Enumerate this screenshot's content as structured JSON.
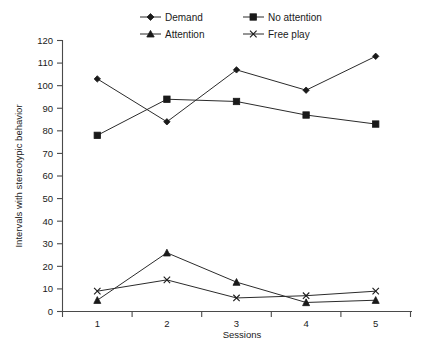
{
  "chart_data": {
    "type": "line",
    "title": "",
    "xlabel": "Sessions",
    "ylabel": "Intervals with stereotypic behavior",
    "categories": [
      "1",
      "2",
      "3",
      "4",
      "5"
    ],
    "xtick_labels": [
      "1",
      "2",
      "3",
      "4",
      "5"
    ],
    "ytick_labels": [
      "0",
      "10",
      "20",
      "30",
      "40",
      "50",
      "60",
      "70",
      "80",
      "90",
      "100",
      "110",
      "120"
    ],
    "ylim": [
      0,
      120
    ],
    "ytick_step": 10,
    "grid": false,
    "legend_position": "top",
    "series": [
      {
        "name": "Demand",
        "marker": "diamond",
        "values": [
          103,
          84,
          107,
          98,
          113
        ]
      },
      {
        "name": "No attention",
        "marker": "square",
        "values": [
          78,
          94,
          93,
          87,
          83
        ]
      },
      {
        "name": "Attention",
        "marker": "triangle",
        "values": [
          5,
          26,
          13,
          4,
          5
        ]
      },
      {
        "name": "Free play",
        "marker": "x",
        "values": [
          9,
          14,
          6,
          7,
          9
        ]
      }
    ]
  },
  "legend": {
    "items": [
      {
        "label": "Demand",
        "marker": "diamond"
      },
      {
        "label": "No attention",
        "marker": "square"
      },
      {
        "label": "Attention",
        "marker": "triangle"
      },
      {
        "label": "Free play",
        "marker": "x"
      }
    ]
  },
  "colors": {
    "ink": "#1a1a1a",
    "axis": "#4a4a4a",
    "background": "#ffffff"
  }
}
